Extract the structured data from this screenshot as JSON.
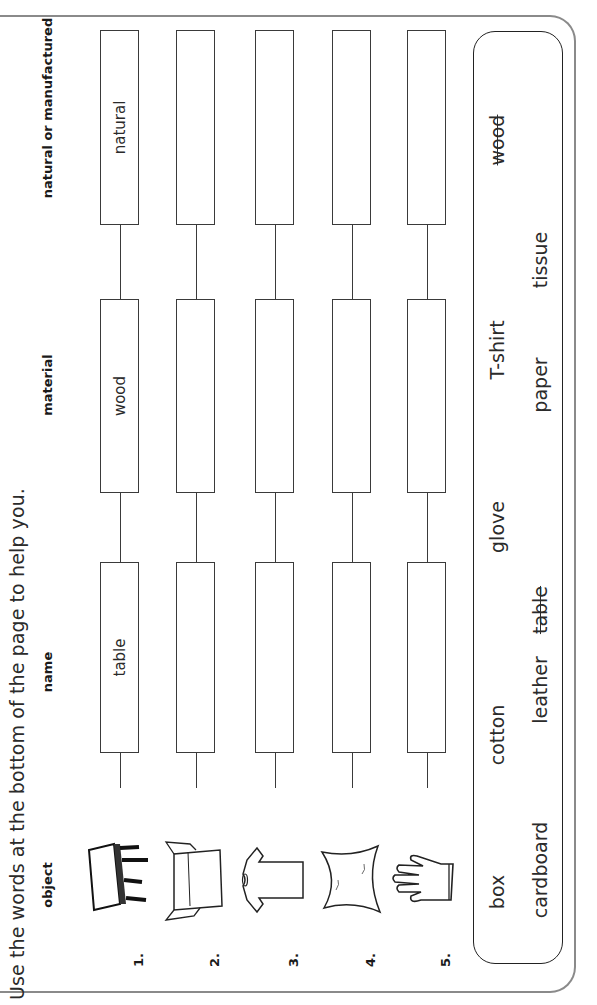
{
  "instruction": "Use the words at the bottom of the page to help you.",
  "headers": {
    "object": "object",
    "name": "name",
    "material": "material",
    "natural_or_manufactured": "natural or manufactured"
  },
  "rows": [
    {
      "number": "1.",
      "object_icon": "table-icon",
      "name": "table",
      "material": "wood",
      "natural_or_manufactured": "natural"
    },
    {
      "number": "2.",
      "object_icon": "box-icon",
      "name": "",
      "material": "",
      "natural_or_manufactured": ""
    },
    {
      "number": "3.",
      "object_icon": "t-shirt-icon",
      "name": "",
      "material": "",
      "natural_or_manufactured": ""
    },
    {
      "number": "4.",
      "object_icon": "tissue-icon",
      "name": "",
      "material": "",
      "natural_or_manufactured": ""
    },
    {
      "number": "5.",
      "object_icon": "glove-icon",
      "name": "",
      "material": "",
      "natural_or_manufactured": ""
    }
  ],
  "word_bank": {
    "row1": [
      {
        "word": "box",
        "crossed_out": false
      },
      {
        "word": "cotton",
        "crossed_out": false
      },
      {
        "word": "glove",
        "crossed_out": false
      },
      {
        "word": "T-shirt",
        "crossed_out": false
      },
      {
        "word": "wood",
        "crossed_out": true
      }
    ],
    "row2": [
      {
        "word": "cardboard",
        "crossed_out": false
      },
      {
        "word": "leather",
        "crossed_out": false
      },
      {
        "word": "table",
        "crossed_out": true
      },
      {
        "word": "paper",
        "crossed_out": false
      },
      {
        "word": "tissue",
        "crossed_out": false
      }
    ]
  }
}
